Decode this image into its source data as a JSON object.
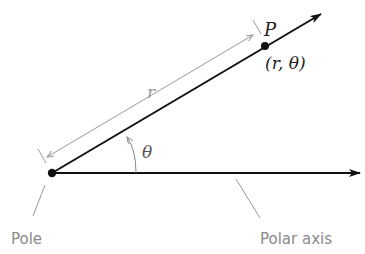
{
  "diagram": {
    "type": "polar-coordinates",
    "labels": {
      "point": "P",
      "coords": "(r, θ)",
      "radius": "r",
      "angle": "θ",
      "pole": "Pole",
      "polar_axis": "Polar axis"
    },
    "colors": {
      "main_line": "#111111",
      "guide_line": "#9a9a9a",
      "label_gray": "#8a8a8a",
      "math_text": "#222222"
    }
  }
}
